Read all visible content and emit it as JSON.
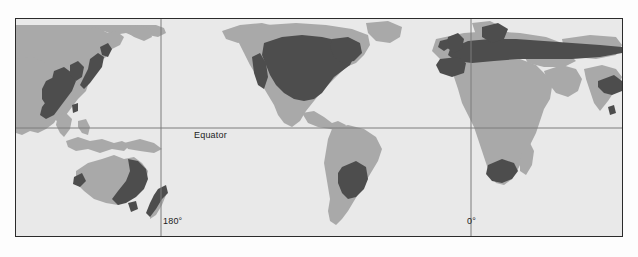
{
  "figure": {
    "type": "world-map",
    "projection": "pacific-centered-cylindrical",
    "background_color": "#ffffff"
  },
  "map": {
    "frame": {
      "border_color": "#2b2b2b",
      "x": 15,
      "y": 18,
      "width": 608,
      "height": 219
    },
    "palette": {
      "ocean": "#e9e9e9",
      "land": "#a9a9a9",
      "highlight": "#4d4d4d",
      "graticule": "#808080"
    },
    "graticule": {
      "equator_y": 109,
      "meridian_180_x": 145,
      "meridian_0_x": 455,
      "color": "#808080"
    },
    "labels": [
      {
        "id": "equator",
        "text": "Equator"
      },
      {
        "id": "meridian-180",
        "text": "180°"
      },
      {
        "id": "meridian-0",
        "text": "0°"
      }
    ],
    "highlighted_regions": [
      "united-states",
      "europe-russia",
      "japan",
      "korea",
      "china-coast",
      "eastern-australia",
      "new-zealand",
      "argentina-uruguay",
      "south-africa",
      "india-coast"
    ],
    "land_regions": [
      "asia",
      "north-america",
      "south-america",
      "africa",
      "australia",
      "greenland",
      "madagascar",
      "southeast-asia"
    ]
  }
}
